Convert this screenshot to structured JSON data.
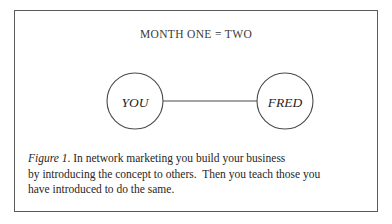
{
  "figure": {
    "title": "MONTH ONE = TWO",
    "caption": {
      "ref": "Figure 1",
      "ref_suffix": ". In network marketing you build your business",
      "line1": "Figure 1. In network marketing you build your business",
      "line2": "by introducing the concept to others.  Then you teach those you",
      "line3": "have introduced to do the same."
    },
    "colors": {
      "border": "#5a5a5a",
      "stroke": "#4a4a4a",
      "text": "#262626",
      "background": "#ffffff"
    }
  },
  "diagram": {
    "type": "node-link",
    "nodes": [
      {
        "id": "you",
        "label": "YOU",
        "cx": 120,
        "cy": 38,
        "r": 28
      },
      {
        "id": "fred",
        "label": "FRED",
        "cx": 270,
        "cy": 38,
        "r": 28
      }
    ],
    "edges": [
      {
        "from": "you",
        "to": "fred",
        "x1": 148,
        "y1": 38,
        "x2": 242,
        "y2": 38
      }
    ]
  }
}
